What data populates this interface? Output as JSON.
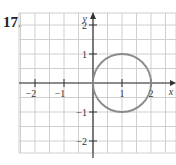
{
  "problem": {
    "number": "17."
  },
  "chart_data": {
    "type": "line",
    "title": "",
    "xlabel": "x",
    "ylabel": "y",
    "xlim": [
      -2.5,
      2.8
    ],
    "ylim": [
      -2.4,
      2.4
    ],
    "grid": true,
    "grid_step": 0.5,
    "x_ticks": [
      -2,
      -1,
      1,
      2
    ],
    "y_ticks": [
      -2,
      -1,
      1,
      2
    ],
    "x_tick_labels": [
      "−2",
      "−1",
      "1",
      "2"
    ],
    "y_tick_labels": [
      "−2",
      "−1",
      "1",
      "2"
    ],
    "series": [
      {
        "name": "circle",
        "shape": "circle",
        "center": [
          1,
          0
        ],
        "radius": 1,
        "color": "#8a8a8a"
      }
    ],
    "colors": {
      "grid": "#cfcfcf",
      "axis": "#333333",
      "curve": "#8a8a8a"
    }
  }
}
